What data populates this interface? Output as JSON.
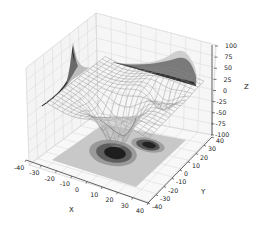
{
  "chart_data": {
    "type": "surface3d",
    "title": "",
    "xlabel": "X",
    "ylabel": "Y",
    "zlabel": "Z",
    "xlim": [
      -40,
      40
    ],
    "ylim": [
      -40,
      40
    ],
    "zlim": [
      -100,
      100
    ],
    "x_ticks": [
      "-40",
      "-30",
      "-20",
      "-10",
      "0",
      "10",
      "20",
      "30",
      "40"
    ],
    "y_ticks": [
      "-40",
      "-30",
      "-20",
      "-10",
      "0",
      "10",
      "20",
      "30",
      "40"
    ],
    "z_ticks": [
      "100",
      "75",
      "50",
      "25",
      "0",
      "-25",
      "-50",
      "-75",
      "-100"
    ],
    "grid": true,
    "colormap": "grayscale",
    "series": [
      {
        "name": "wireframe surface",
        "kind": "wireframe",
        "features": [
          "broad trough reaching approx z=-80 near x=0..10, y=-10",
          "secondary dip near x=20, y=10",
          "rim around z=0..25"
        ]
      },
      {
        "name": "contour offset z=-100",
        "kind": "contourf",
        "features": [
          "two dark minima: larger near x=0, y=-10; smaller near x=20, y=15"
        ]
      },
      {
        "name": "contour offset x=-40",
        "kind": "contourf",
        "features": [
          "sharp peak up to ~100 near y=0"
        ]
      },
      {
        "name": "contour offset y=40",
        "kind": "contourf",
        "features": [
          "broad hump up to ~75 near x=20..40"
        ]
      }
    ]
  }
}
